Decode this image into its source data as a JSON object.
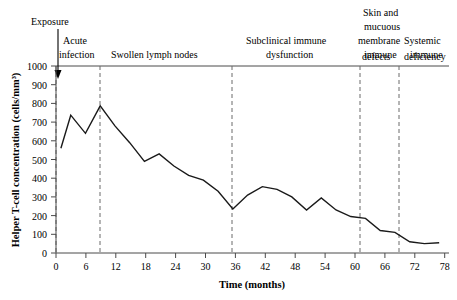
{
  "chart_data": {
    "type": "line",
    "title": "",
    "xlabel": "Time (months)",
    "ylabel": "Helper T-cell concentration (cells/mm³)",
    "xlim": [
      0,
      80
    ],
    "ylim": [
      0,
      1000
    ],
    "grid": false,
    "legend": "none",
    "x_ticks": [
      0,
      6,
      12,
      18,
      24,
      30,
      36,
      42,
      48,
      54,
      60,
      66,
      72,
      78
    ],
    "y_ticks": [
      0,
      100,
      200,
      300,
      400,
      500,
      600,
      700,
      800,
      900,
      1000
    ],
    "x": [
      1,
      3,
      6,
      9,
      12,
      15,
      18,
      21,
      24,
      27,
      30,
      33,
      36,
      39,
      42,
      45,
      48,
      51,
      54,
      57,
      60,
      63,
      66,
      69,
      72,
      75,
      78
    ],
    "values": [
      560,
      737,
      640,
      787,
      680,
      590,
      490,
      530,
      465,
      415,
      390,
      330,
      235,
      310,
      355,
      340,
      300,
      230,
      295,
      230,
      195,
      185,
      120,
      110,
      60,
      50,
      55
    ],
    "series": [
      {
        "name": "Helper T-cell concentration",
        "values": [
          560,
          737,
          640,
          787,
          680,
          590,
          490,
          530,
          465,
          415,
          390,
          330,
          235,
          310,
          355,
          340,
          300,
          230,
          295,
          230,
          195,
          185,
          120,
          110,
          60,
          50,
          55
        ]
      }
    ],
    "annotations": [
      {
        "label": "Exposure",
        "x": 0,
        "kind": "arrow-marker"
      }
    ],
    "phase_dividers": [
      0,
      9,
      36,
      62,
      70
    ],
    "phases": [
      {
        "label": "Acute infection",
        "start": 0,
        "end": 9,
        "lines": [
          "Acute",
          "infection"
        ]
      },
      {
        "label": "Swollen lymph nodes",
        "start": 9,
        "end": 36,
        "lines": [
          "Swollen lymph nodes"
        ]
      },
      {
        "label": "Subclinical immune dysfunction",
        "start": 36,
        "end": 62,
        "lines": [
          "Subclinical immune",
          "dysfunction"
        ]
      },
      {
        "label": "Skin and mucuous membrane immune defects",
        "start": 62,
        "end": 70,
        "lines": [
          "Skin and",
          "mucuous",
          "membrane",
          "immune",
          "defects"
        ]
      },
      {
        "label": "Systemic immune deficiency",
        "start": 70,
        "end": 80,
        "lines": [
          "Systemic",
          "immune",
          "deficiency"
        ]
      }
    ]
  },
  "labels": {
    "exposure": "Exposure",
    "acute_1": "Acute",
    "acute_2": "infection",
    "swollen": "Swollen lymph nodes",
    "subclinical_1": "Subclinical immune",
    "subclinical_2": "dysfunction",
    "skin_1": "Skin and",
    "skin_2": "mucuous",
    "skin_3": "membrane",
    "skin_4": "immune",
    "skin_5": "defects",
    "systemic_1": "Systemic",
    "systemic_2": "immune",
    "systemic_3": "deficiency",
    "y_axis_title": "Helper T-cell concentration (cells/mm³)",
    "x_axis_title": "Time (months)",
    "y0": "0",
    "y100": "100",
    "y200": "200",
    "y300": "300",
    "y400": "400",
    "y500": "500",
    "y600": "600",
    "y700": "700",
    "y800": "800",
    "y900": "900",
    "y1000": "1000",
    "x0": "0",
    "x6": "6",
    "x12": "12",
    "x18": "18",
    "x24": "24",
    "x30": "30",
    "x36": "36",
    "x42": "42",
    "x48": "48",
    "x54": "54",
    "x60": "60",
    "x66": "66",
    "x72": "72",
    "x78": "78"
  },
  "colors": {
    "line": "#1a1a1a",
    "axis": "#4a4a4a",
    "divider": "#6b6b6b",
    "background": "#ffffff"
  }
}
